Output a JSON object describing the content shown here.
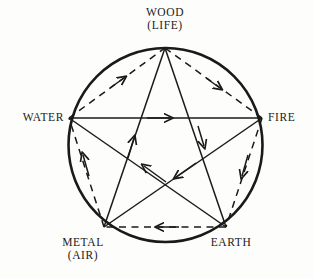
{
  "diagram": {
    "background_color": "#fdfdfb",
    "ink_color": "#1a1a1a",
    "nodes": [
      {
        "id": "wood",
        "name": "WOOD",
        "alt": "(LIFE)",
        "x": 165,
        "y": 48,
        "angle_deg": 90
      },
      {
        "id": "fire",
        "name": "FIRE",
        "alt": "",
        "x": 262,
        "y": 118,
        "angle_deg": 18
      },
      {
        "id": "earth",
        "name": "EARTH",
        "alt": "",
        "x": 226,
        "y": 227,
        "angle_deg": 306
      },
      {
        "id": "metal",
        "name": "METAL",
        "alt": "(AIR)",
        "x": 104,
        "y": 227,
        "angle_deg": 234
      },
      {
        "id": "water",
        "name": "WATER",
        "alt": "",
        "x": 69,
        "y": 118,
        "angle_deg": 162
      }
    ],
    "circle": {
      "cx": 165.5,
      "cy": 145,
      "r": 97,
      "stroke_width": 2.6
    },
    "generating_cycle": {
      "style": "dashed",
      "edges": [
        {
          "from": "water",
          "to": "wood"
        },
        {
          "from": "wood",
          "to": "fire"
        },
        {
          "from": "fire",
          "to": "earth"
        },
        {
          "from": "earth",
          "to": "metal"
        },
        {
          "from": "metal",
          "to": "water"
        }
      ]
    },
    "overcoming_cycle": {
      "style": "solid",
      "edges": [
        {
          "from": "water",
          "to": "fire"
        },
        {
          "from": "fire",
          "to": "metal"
        },
        {
          "from": "metal",
          "to": "wood"
        },
        {
          "from": "wood",
          "to": "earth"
        },
        {
          "from": "earth",
          "to": "water"
        }
      ]
    }
  }
}
